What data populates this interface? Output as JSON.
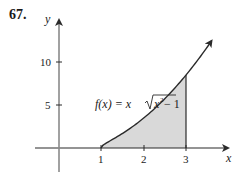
{
  "problem": {
    "number": "67."
  },
  "chart_data": {
    "type": "area",
    "title": "",
    "function_label": "f(x) = x√(x² − 1)",
    "function_label_parts": {
      "lhs": "f(x) = x",
      "radicand": "x",
      "exponent": "2",
      "tail": " − 1"
    },
    "xlabel": "x",
    "ylabel": "y",
    "x_ticks": [
      "1",
      "2",
      "3"
    ],
    "y_ticks": [
      "5",
      "10"
    ],
    "xlim": [
      -0.5,
      4
    ],
    "ylim": [
      -3,
      14
    ],
    "shaded_region": {
      "from": 1,
      "to": 3,
      "fill": "#d9d9d9"
    },
    "x": [
      1,
      1.25,
      1.5,
      1.75,
      2,
      2.25,
      2.5,
      2.75,
      3,
      3.25,
      3.6
    ],
    "values": [
      0,
      0.94,
      1.68,
      2.51,
      3.46,
      4.53,
      5.73,
      7.06,
      8.49,
      10.05,
      12.07
    ],
    "grid": false,
    "legend": "none",
    "colors": {
      "curve": "#2a2a2a",
      "axis": "#2a2a2a",
      "shade": "#d9d9d9"
    }
  }
}
